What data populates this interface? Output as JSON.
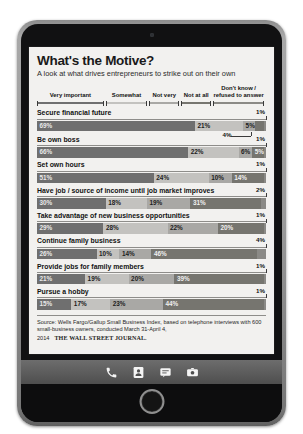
{
  "device": {
    "dock": [
      {
        "name": "phone-icon",
        "label": "Phone"
      },
      {
        "name": "contacts-icon",
        "label": "Contacts"
      },
      {
        "name": "messages-icon",
        "label": "Messages"
      },
      {
        "name": "camera-icon",
        "label": "Camera"
      }
    ],
    "home_button_label": "Home"
  },
  "chart_panel": {
    "title": "What's the Motive?",
    "subtitle": "A look at what drives entrepreneurs to strike out on their own",
    "source_text": "Source: Wells Fargo/Gallup Small Business Index, based on telephone interviews with 600 small-business owners, conducted March 31-April 4, 2014",
    "publisher": "THE WALL STREET JOURNAL."
  },
  "chart_data": {
    "type": "bar",
    "subtype": "100% stacked horizontal bar",
    "title": "What's the Motive?",
    "subtitle": "A look at what drives entrepreneurs to strike out on their own",
    "xlabel": "",
    "ylabel": "",
    "xlim": [
      0,
      100
    ],
    "units": "percent",
    "grid": false,
    "legend_position": "top",
    "legend": [
      {
        "label": "Very important",
        "color": "#6f6f6f"
      },
      {
        "label": "Somewhat",
        "color": "#c3c2bf"
      },
      {
        "label": "Not very",
        "color": "#a9a8a5"
      },
      {
        "label": "Not at all",
        "color": "#76756f"
      },
      {
        "label": "Don't know /\nrefused to answer",
        "color": "#8b8a86"
      }
    ],
    "series": [
      {
        "name": "Very important",
        "values": [
          69,
          66,
          51,
          30,
          29,
          26,
          21,
          15
        ]
      },
      {
        "name": "Somewhat",
        "values": [
          21,
          22,
          24,
          18,
          28,
          10,
          19,
          17
        ]
      },
      {
        "name": "Not very",
        "values": [
          5,
          6,
          10,
          19,
          22,
          14,
          20,
          23
        ]
      },
      {
        "name": "Not at all",
        "values": [
          4,
          5,
          14,
          31,
          20,
          46,
          39,
          44
        ]
      },
      {
        "name": "Don't know / refused to answer",
        "values": [
          1,
          1,
          1,
          2,
          1,
          4,
          1,
          1
        ]
      }
    ],
    "categories": [
      "Secure financial future",
      "Be own boss",
      "Set own hours",
      "Have job / source of income until job market improves",
      "Take advantage of new business opportunities",
      "Continue family business",
      "Provide jobs for family members",
      "Pursue a hobby"
    ],
    "rows": [
      {
        "label": "Secure financial future",
        "segments": [
          {
            "value": 69,
            "text": "69%",
            "inside": true
          },
          {
            "value": 21,
            "text": "21%",
            "inside": true
          },
          {
            "value": 5,
            "text": "5%",
            "inside": true
          },
          {
            "value": 4,
            "text": "4%",
            "inside": false,
            "position": "below"
          },
          {
            "value": 1,
            "text": "1%",
            "inside": false,
            "position": "above"
          }
        ]
      },
      {
        "label": "Be own boss",
        "segments": [
          {
            "value": 66,
            "text": "66%",
            "inside": true
          },
          {
            "value": 22,
            "text": "22%",
            "inside": true
          },
          {
            "value": 6,
            "text": "6%",
            "inside": true
          },
          {
            "value": 5,
            "text": "5%",
            "inside": true
          },
          {
            "value": 1,
            "text": "1%",
            "inside": false,
            "position": "above"
          }
        ]
      },
      {
        "label": "Set own hours",
        "segments": [
          {
            "value": 51,
            "text": "51%",
            "inside": true
          },
          {
            "value": 24,
            "text": "24%",
            "inside": true
          },
          {
            "value": 10,
            "text": "10%",
            "inside": true
          },
          {
            "value": 14,
            "text": "14%",
            "inside": true
          },
          {
            "value": 1,
            "text": "1%",
            "inside": false,
            "position": "above"
          }
        ]
      },
      {
        "label": "Have job / source of income until job market improves",
        "segments": [
          {
            "value": 30,
            "text": "30%",
            "inside": true
          },
          {
            "value": 18,
            "text": "18%",
            "inside": true
          },
          {
            "value": 19,
            "text": "19%",
            "inside": true
          },
          {
            "value": 31,
            "text": "31%",
            "inside": true
          },
          {
            "value": 2,
            "text": "2%",
            "inside": false,
            "position": "above"
          }
        ]
      },
      {
        "label": "Take advantage of new business opportunities",
        "segments": [
          {
            "value": 29,
            "text": "29%",
            "inside": true
          },
          {
            "value": 28,
            "text": "28%",
            "inside": true
          },
          {
            "value": 22,
            "text": "22%",
            "inside": true
          },
          {
            "value": 20,
            "text": "20%",
            "inside": true
          },
          {
            "value": 1,
            "text": "1%",
            "inside": false,
            "position": "above"
          }
        ]
      },
      {
        "label": "Continue family business",
        "segments": [
          {
            "value": 26,
            "text": "26%",
            "inside": true
          },
          {
            "value": 10,
            "text": "10%",
            "inside": true
          },
          {
            "value": 14,
            "text": "14%",
            "inside": true
          },
          {
            "value": 46,
            "text": "46%",
            "inside": true
          },
          {
            "value": 4,
            "text": "4%",
            "inside": false,
            "position": "above"
          }
        ]
      },
      {
        "label": "Provide jobs for family members",
        "segments": [
          {
            "value": 21,
            "text": "21%",
            "inside": true
          },
          {
            "value": 19,
            "text": "19%",
            "inside": true
          },
          {
            "value": 20,
            "text": "20%",
            "inside": true
          },
          {
            "value": 39,
            "text": "39%",
            "inside": true
          },
          {
            "value": 1,
            "text": "1%",
            "inside": false,
            "position": "above"
          }
        ]
      },
      {
        "label": "Pursue a hobby",
        "segments": [
          {
            "value": 15,
            "text": "15%",
            "inside": true
          },
          {
            "value": 17,
            "text": "17%",
            "inside": true
          },
          {
            "value": 23,
            "text": "23%",
            "inside": true
          },
          {
            "value": 44,
            "text": "44%",
            "inside": true
          },
          {
            "value": 1,
            "text": "1%",
            "inside": false,
            "position": "above"
          }
        ]
      }
    ]
  }
}
